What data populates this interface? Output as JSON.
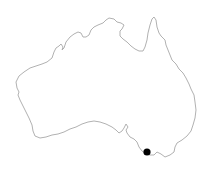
{
  "map": {
    "region": "Australia",
    "outline_color": "#a8a8a8",
    "fill_color": "#ffffff",
    "background": "#ffffff",
    "outline_path": "M17,88 L16,82 L19,76 L24,72 L30,68 L36,66 L42,64 L47,62 L52,58 L54,52 L56,48 L59,46 L61,44 L63,47 L62,50 L64,48 L66,42 L70,37 L74,34 L78,32 L81,33 L83,37 L86,37 L89,35 L91,30 L94,27 L98,25 L103,23 L106,20 L109,18 L114,19 L117,22 L121,23 L124,25 L122,29 L120,31 L120,36 L123,39 L127,42 L131,46 L135,49 L139,51 L143,51 L145,47 L147,40 L148,33 L150,25 L152,19 L154,17 L156,20 L157,27 L159,33 L161,36 L165,40 L166,45 L168,50 L170,55 L172,60 L176,64 L179,69 L183,73 L186,78 L189,84 L191,89 L194,95 L195,102 L196,110 L195,118 L193,125 L191,131 L187,136 L182,140 L177,143 L175,147 L174,152 L170,155 L165,157 L161,154 L157,152 L154,155 L150,155 L146,154 L142,151 L139,147 L137,142 L134,139 L130,137 L127,133 L126,130 L128,127 L126,124 L124,128 L122,131 L119,133 L116,130 L112,127 L106,124 L100,122 L94,121 L88,122 L82,124 L76,127 L70,129 L64,132 L58,134 L52,135 L46,137 L40,138 L35,136 L33,131 L32,125 L29,118 L26,112 L23,106 L20,100 L18,95 L19,92 L17,88 Z",
    "marker": {
      "label": "location-marker",
      "x": 147,
      "y": 152,
      "radius": 3.6,
      "color": "#000000"
    }
  }
}
